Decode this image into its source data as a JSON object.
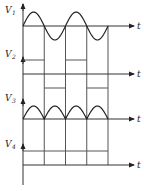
{
  "diagram": {
    "time_axis_label": "t",
    "half_periods": 4,
    "panels": [
      {
        "id": "V1",
        "label": "V",
        "subscript": "1",
        "waveform": "sine",
        "description": "Full sine wave, two periods"
      },
      {
        "id": "V2",
        "label": "V",
        "subscript": "2",
        "waveform": "square",
        "description": "Square wave: high in first half-period, low in second"
      },
      {
        "id": "V3",
        "label": "V",
        "subscript": "3",
        "waveform": "full-wave-rectified",
        "description": "Full-wave rectified sine, four positive humps"
      },
      {
        "id": "V4",
        "label": "V",
        "subscript": "4",
        "waveform": "constant",
        "description": "Constant positive DC level"
      }
    ]
  }
}
